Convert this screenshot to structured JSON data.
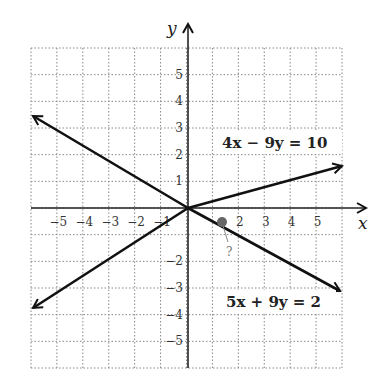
{
  "chart_data": {
    "type": "line",
    "title": "",
    "xlabel": "x",
    "ylabel": "y",
    "xlim": [
      -6,
      6
    ],
    "ylim": [
      -6,
      6
    ],
    "grid": true,
    "x_ticks": [
      "-5",
      "-4",
      "-3",
      "-2",
      "-1",
      "2",
      "3",
      "4",
      "5"
    ],
    "y_ticks": [
      "5",
      "4",
      "3",
      "2",
      "1",
      "-2",
      "-3",
      "-4",
      "-5"
    ],
    "series": [
      {
        "name": "4x − 9y = 10",
        "equation": "4x - 9y = 10",
        "x": [
          -6,
          6
        ],
        "y": [
          -3.78,
          1.56
        ]
      },
      {
        "name": "5x + 9y = 2",
        "equation": "5x + 9y = 2",
        "x": [
          -6,
          5.9
        ],
        "y": [
          3.56,
          -3.06
        ]
      }
    ],
    "annotations": [
      {
        "text": "?",
        "point": [
          0.94,
          -0.69
        ],
        "note": "intersection point marked"
      }
    ]
  },
  "labels": {
    "x_axis": "x",
    "y_axis": "y",
    "eq1": "4x − 9y = 10",
    "eq2": "5x + 9y = 2",
    "question": "?",
    "xt": [
      "−5",
      "−4",
      "−3",
      "−2",
      "−1",
      "2",
      "3",
      "4",
      "5"
    ],
    "yt": [
      "5",
      "4",
      "3",
      "2",
      "1",
      "−2",
      "−3",
      "−4",
      "−5"
    ]
  }
}
